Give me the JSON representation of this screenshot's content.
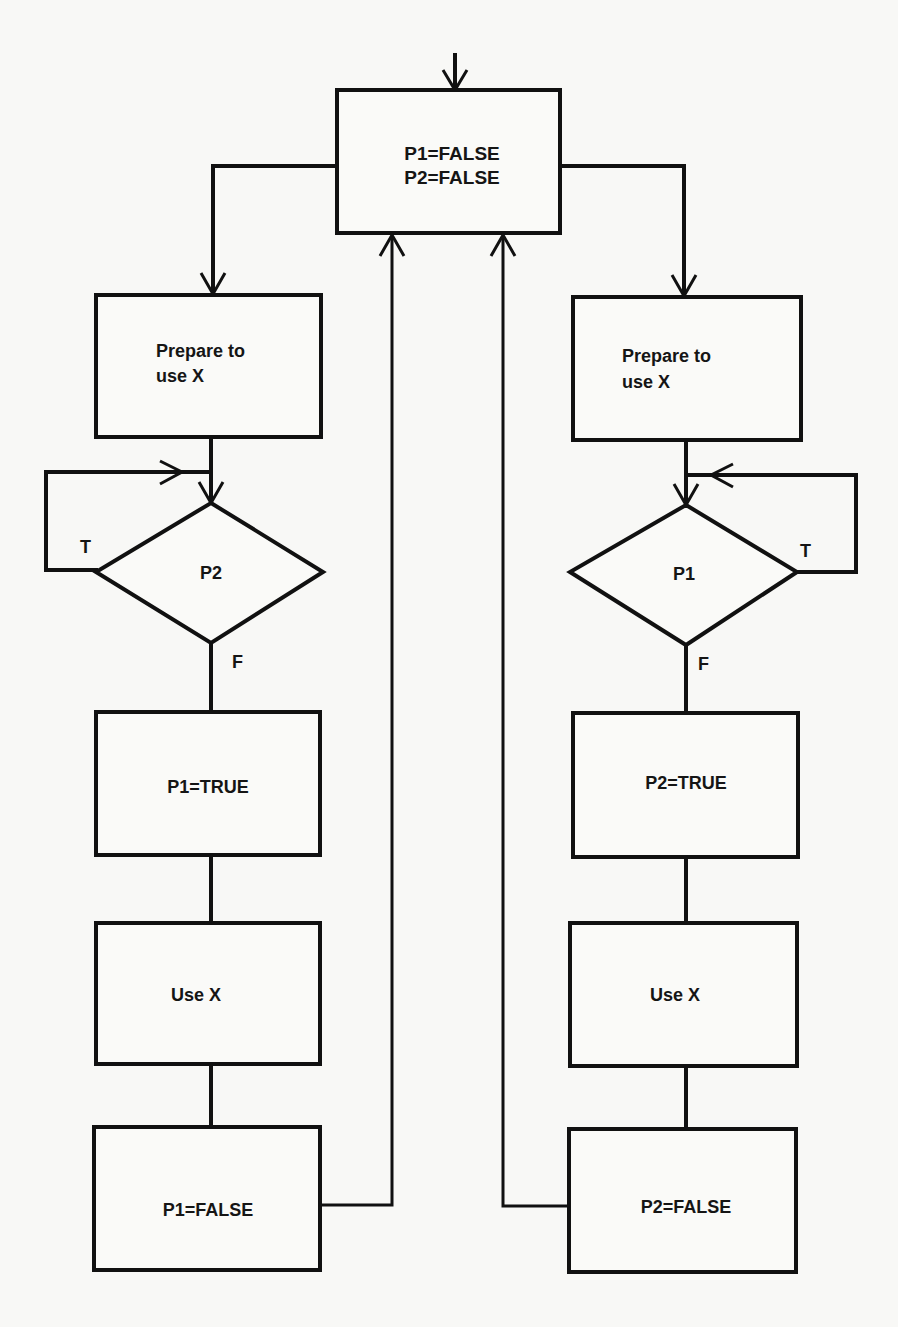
{
  "diagram": {
    "type": "flowchart",
    "nodes": {
      "init": {
        "line1": "P1=FALSE",
        "line2": "P2=FALSE"
      },
      "left": {
        "prepare_line1": "Prepare to",
        "prepare_line2": "use X",
        "decision": "P2",
        "true_label": "T",
        "false_label": "F",
        "set_true": "P1=TRUE",
        "use": "Use X",
        "set_false": "P1=FALSE"
      },
      "right": {
        "prepare_line1": "Prepare to",
        "prepare_line2": "use X",
        "decision": "P1",
        "true_label": "T",
        "false_label": "F",
        "set_true": "P2=TRUE",
        "use": "Use X",
        "set_false": "P2=FALSE"
      }
    },
    "edges": [
      {
        "from": "entry",
        "to": "init"
      },
      {
        "from": "init",
        "to": "left.prepare"
      },
      {
        "from": "init",
        "to": "right.prepare"
      },
      {
        "from": "left.prepare",
        "to": "left.decision"
      },
      {
        "from": "left.decision",
        "to": "left.decision",
        "label": "T"
      },
      {
        "from": "left.decision",
        "to": "left.set_true",
        "label": "F"
      },
      {
        "from": "left.set_true",
        "to": "left.use"
      },
      {
        "from": "left.use",
        "to": "left.set_false"
      },
      {
        "from": "left.set_false",
        "to": "init"
      },
      {
        "from": "right.prepare",
        "to": "right.decision"
      },
      {
        "from": "right.decision",
        "to": "right.decision",
        "label": "T"
      },
      {
        "from": "right.decision",
        "to": "right.set_true",
        "label": "F"
      },
      {
        "from": "right.set_true",
        "to": "right.use"
      },
      {
        "from": "right.use",
        "to": "right.set_false"
      },
      {
        "from": "right.set_false",
        "to": "init"
      }
    ]
  }
}
